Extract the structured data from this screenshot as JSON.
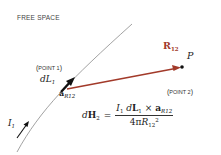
{
  "diagram": {
    "region_label": "FREE SPACE",
    "point1": {
      "open": "(",
      "text": "POINT 1",
      "close": ")"
    },
    "point2": {
      "open": "(",
      "text": "POINT 2",
      "close": ")"
    },
    "current_label": "I",
    "current_sub": "1",
    "element_label": "dL",
    "element_sub": "1",
    "unit_vector": "a",
    "unit_vector_sub": "R12",
    "distance_vector": "R",
    "distance_vector_sub": "12",
    "field_point": "P",
    "colors": {
      "distance_vector": "#a23a2a",
      "curve": "#888888",
      "element_arrow": "#111111"
    }
  },
  "equation": {
    "lhs_d": "d",
    "lhs_H": "H",
    "lhs_sub": "2",
    "equals": "=",
    "num_I": "I",
    "num_I_sub": "1",
    "num_d": "d",
    "num_L": "L",
    "num_L_sub": "1",
    "cross": "×",
    "num_a": "a",
    "num_a_sub": "R12",
    "den_coef": "4π",
    "den_R": "R",
    "den_R_sub": "12",
    "den_exp": "2"
  }
}
